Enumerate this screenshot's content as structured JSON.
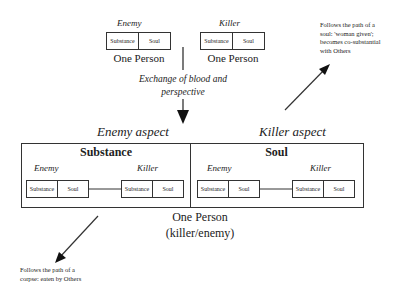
{
  "top": {
    "enemy": {
      "label": "Enemy",
      "substance": "Substance",
      "soul": "Soul",
      "caption": "One Person"
    },
    "killer": {
      "label": "Killer",
      "substance": "Substance",
      "soul": "Soul",
      "caption": "One Person"
    }
  },
  "exchange_label_line1": "Exchange of blood and",
  "exchange_label_line2": "perspective",
  "aspects": {
    "enemy_aspect": "Enemy aspect",
    "killer_aspect": "Killer aspect"
  },
  "panels": {
    "substance": {
      "title": "Substance",
      "left": {
        "label": "Enemy",
        "substance": "Substance",
        "soul": "Soul"
      },
      "right": {
        "label": "Killer",
        "substance": "Substance",
        "soul": "Soul"
      }
    },
    "soul": {
      "title": "Soul",
      "left": {
        "label": "Enemy",
        "substance": "Substance",
        "soul": "Soul"
      },
      "right": {
        "label": "Killer",
        "substance": "Substance",
        "soul": "Soul"
      }
    }
  },
  "bottom_caption_line1": "One Person",
  "bottom_caption_line2": "(killer/enemy)",
  "notes": {
    "soul_path": [
      "Follows the path of a",
      "soul: 'woman given';",
      "becomes co-substantial",
      "with Others"
    ],
    "corpse_path": [
      "Follows the path of a",
      "corpse: eaten by Others"
    ]
  }
}
